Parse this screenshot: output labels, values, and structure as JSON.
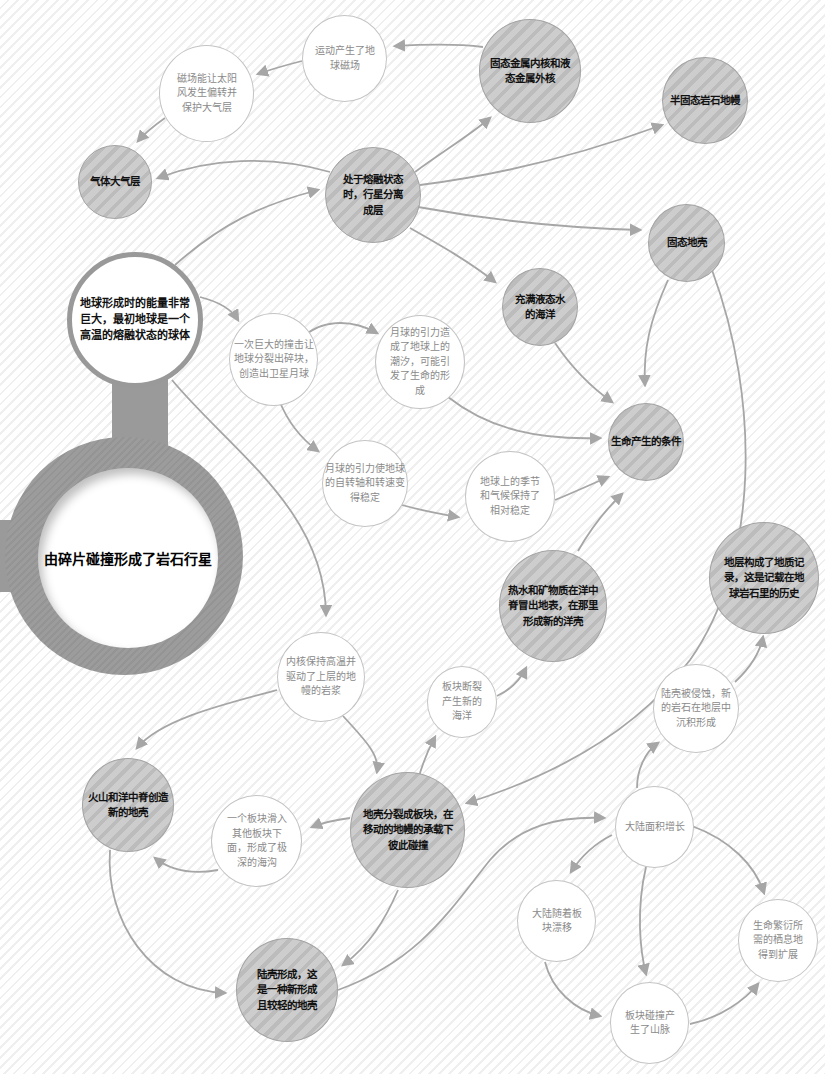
{
  "diagram": {
    "root": "由碎片碰撞形成了岩石行星",
    "nodes": {
      "hot_earth": "地球形成时的能量非常巨大，最初地球是一个高温的熔融状态的球体",
      "layering": "处于熔融状态时，行星分离成层",
      "core": "固态金属内核和液态金属外核",
      "magnetic_field": "运动产生了地球磁场",
      "solar_wind": "磁场能让太阳风发生偏转并保护大气层",
      "atmosphere": "气体大气层",
      "mantle": "半固态岩石地幔",
      "crust": "固态地壳",
      "ocean": "充满液态水的海洋",
      "life_conditions": "生命产生的条件",
      "impact_moon": "一次巨大的撞击让地球分裂出碎块，创造出卫星月球",
      "tides": "月球的引力造成了地球上的潮汐，可能引发了生命的形成",
      "rotation": "月球的引力使地球的自转轴和转速变得稳定",
      "seasons": "地球上的季节和气候保持了相对稳定",
      "hydrothermal": "热水和矿物质在洋中脊冒出地表，在那里形成新的洋壳",
      "strata_record": "地层构成了地质记录，这是记载在地球岩石里的历史",
      "inner_core_heat": "内核保持高温并驱动了上层的地幔的岩浆",
      "plate_split": "板块断裂产生新的海洋",
      "erosion": "陆壳被侵蚀，新的岩石在地层中沉积形成",
      "volcano": "火山和洋中脊创造新的地壳",
      "plates": "地壳分裂成板块，在移动的地幔的承载下彼此碰撞",
      "subduction": "一个板块滑入其他板块下面，形成了极深的海沟",
      "continent_growth": "大陆面积增长",
      "continental_crust": "陆壳形成，这是一种新形成且较轻的地壳",
      "drift": "大陆随着板块漂移",
      "habitat": "生命繁衍所需的栖息地得到扩展",
      "mountains": "板块碰撞产生了山脉"
    },
    "colors": {
      "gray_node": "#c6c6c6",
      "white_node": "#ffffff",
      "edge": "#a6a6a6",
      "hub_ring": "#9a9a9a"
    }
  }
}
